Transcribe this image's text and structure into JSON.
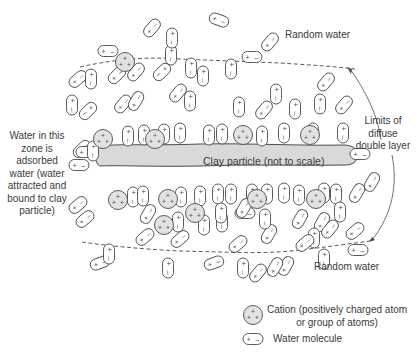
{
  "labels": {
    "random_water_top": "Random water",
    "random_water_bottom": "Random water",
    "limits": [
      "Limits of",
      "diffuse",
      "double layer"
    ],
    "adsorbed": [
      "Water in this",
      "zone is",
      "adsorbed",
      "water (water",
      "attracted and",
      "bound to clay",
      "particle)"
    ],
    "clay_particle": "Clay particle (not to scale)",
    "legend_cation": [
      "Cation (positively charged atom",
      "or group of atoms)"
    ],
    "legend_water": "Water molecule"
  },
  "colors": {
    "stroke": "#4a4a4a",
    "clay_fill": "#d9d9d9",
    "cation_fill": "#e2e2e2",
    "text": "#3a3a3a"
  },
  "cations": [
    [
      125,
      62
    ],
    [
      103,
      139
    ],
    [
      155,
      139
    ],
    [
      243,
      135
    ],
    [
      310,
      135
    ],
    [
      118,
      200
    ],
    [
      168,
      199
    ],
    [
      257,
      199
    ],
    [
      316,
      199
    ],
    [
      195,
      213
    ],
    [
      164,
      225
    ]
  ],
  "waters": [
    [
      152,
      28,
      -50
    ],
    [
      219,
      20,
      20
    ],
    [
      108,
      51,
      0
    ],
    [
      78,
      79,
      -40
    ],
    [
      91,
      79,
      90
    ],
    [
      136,
      72,
      -50
    ],
    [
      171,
      55,
      90
    ],
    [
      172,
      38,
      90
    ],
    [
      270,
      42,
      -50
    ],
    [
      252,
      57,
      0
    ],
    [
      326,
      82,
      -50
    ],
    [
      231,
      69,
      90
    ],
    [
      162,
      72,
      135
    ],
    [
      191,
      68,
      90
    ],
    [
      203,
      76,
      90
    ],
    [
      178,
      93,
      -50
    ],
    [
      123,
      104,
      -50
    ],
    [
      190,
      101,
      90
    ],
    [
      276,
      94,
      90
    ],
    [
      239,
      107,
      90
    ],
    [
      264,
      110,
      -50
    ],
    [
      295,
      109,
      90
    ],
    [
      320,
      104,
      90
    ],
    [
      344,
      105,
      -50
    ],
    [
      72,
      105,
      90
    ],
    [
      88,
      111,
      135
    ],
    [
      136,
      101,
      -60
    ],
    [
      117,
      75,
      -45
    ],
    [
      82,
      149,
      -45
    ],
    [
      86,
      152,
      0
    ],
    [
      93,
      151,
      90
    ],
    [
      128,
      136,
      90
    ],
    [
      144,
      135,
      90
    ],
    [
      164,
      134,
      90
    ],
    [
      180,
      133,
      90
    ],
    [
      209,
      135,
      90
    ],
    [
      222,
      134,
      90
    ],
    [
      262,
      136,
      90
    ],
    [
      284,
      133,
      90
    ],
    [
      313,
      133,
      90
    ],
    [
      343,
      133,
      90
    ],
    [
      360,
      154,
      0
    ],
    [
      79,
      165,
      0
    ],
    [
      133,
      197,
      90
    ],
    [
      143,
      196,
      90
    ],
    [
      181,
      197,
      90
    ],
    [
      200,
      196,
      90
    ],
    [
      218,
      194,
      90
    ],
    [
      231,
      194,
      90
    ],
    [
      252,
      194,
      90
    ],
    [
      267,
      194,
      90
    ],
    [
      284,
      193,
      90
    ],
    [
      299,
      195,
      90
    ],
    [
      324,
      193,
      90
    ],
    [
      336,
      194,
      90
    ],
    [
      78,
      205,
      -40
    ],
    [
      148,
      214,
      -60
    ],
    [
      178,
      222,
      90
    ],
    [
      204,
      225,
      90
    ],
    [
      269,
      234,
      -60
    ],
    [
      245,
      213,
      0
    ],
    [
      265,
      219,
      90
    ],
    [
      340,
      212,
      90
    ],
    [
      300,
      219,
      -60
    ],
    [
      322,
      222,
      -60
    ],
    [
      357,
      193,
      -60
    ],
    [
      372,
      182,
      -60
    ],
    [
      145,
      237,
      -40
    ],
    [
      180,
      239,
      -40
    ],
    [
      222,
      222,
      90
    ],
    [
      238,
      244,
      -40
    ],
    [
      244,
      208,
      -60
    ],
    [
      314,
      238,
      90
    ],
    [
      305,
      243,
      -40
    ],
    [
      330,
      229,
      -50
    ],
    [
      355,
      231,
      -40
    ],
    [
      85,
      219,
      -40
    ],
    [
      221,
      213,
      90
    ],
    [
      100,
      263,
      -20
    ],
    [
      109,
      254,
      90
    ],
    [
      214,
      263,
      -20
    ],
    [
      243,
      268,
      90
    ],
    [
      286,
      266,
      -60
    ],
    [
      358,
      250,
      0
    ],
    [
      168,
      268,
      90
    ],
    [
      258,
      273,
      -50
    ],
    [
      275,
      267,
      -60
    ],
    [
      324,
      259,
      90
    ]
  ],
  "legend": {
    "cation": [
      253,
      315
    ],
    "water": [
      253,
      339
    ]
  }
}
